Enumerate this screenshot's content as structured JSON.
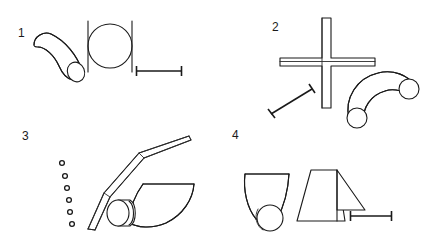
{
  "figure": {
    "background_color": "#ffffff",
    "stroke_color": "#1a1a1a",
    "width": 441,
    "height": 247
  },
  "panels": [
    {
      "label": "1",
      "objects": [
        "curved-tube-with-elliptical-opening",
        "circle-between-two-vertical-bars",
        "horizontal-scale-bar"
      ]
    },
    {
      "label": "2",
      "objects": [
        "plus-shaped-cross-bar",
        "arc-shaped-tube-with-two-circular-openings",
        "diagonal-scale-bar"
      ]
    },
    {
      "label": "3",
      "objects": [
        "column-of-six-small-circles",
        "bent-blade-needle",
        "curved-fan-blade-with-cylinder"
      ]
    },
    {
      "label": "4",
      "objects": [
        "curved-funnel-with-circle",
        "trapezoid-with-triangular-flap",
        "horizontal-scale-bar"
      ]
    }
  ]
}
